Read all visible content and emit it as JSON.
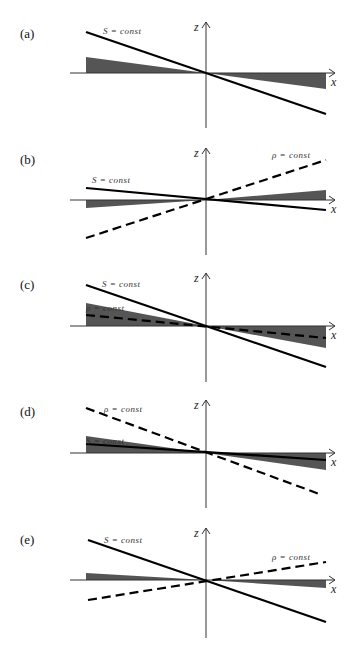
{
  "figure": {
    "axis_labels": {
      "x": "x",
      "z": "z"
    },
    "colors": {
      "shade": "#555555",
      "line": "#000000",
      "axis": "#333333"
    },
    "panels": [
      {
        "id": "a",
        "label": "(a)",
        "axis_y": 73,
        "z_top": 22,
        "z_bottom": 128,
        "shade": {
          "left_y": 57,
          "right_y": 89
        },
        "s_line": {
          "label": "S = const",
          "x1": 86,
          "y1": 32,
          "x2": 326,
          "y2": 114,
          "label_x": 103,
          "label_y": 34
        },
        "rho_line": null
      },
      {
        "id": "b",
        "label": "(b)",
        "axis_y": 200,
        "z_top": 148,
        "z_bottom": 255,
        "shade": {
          "left_y": 208,
          "right_y": 190
        },
        "s_line": {
          "label": "S = const",
          "x1": 86,
          "y1": 188,
          "x2": 326,
          "y2": 210,
          "label_x": 92,
          "label_y": 183
        },
        "rho_line": {
          "label": "ρ = const",
          "x1": 86,
          "y1": 238,
          "x2": 326,
          "y2": 160,
          "label_x": 272,
          "label_y": 158
        }
      },
      {
        "id": "c",
        "label": "(c)",
        "axis_y": 326,
        "z_top": 273,
        "z_bottom": 382,
        "shade": {
          "left_y": 303,
          "right_y": 348
        },
        "s_line": {
          "label": "S = const",
          "x1": 86,
          "y1": 285,
          "x2": 326,
          "y2": 367,
          "label_x": 102,
          "label_y": 287
        },
        "rho_line": {
          "label": "ρ = const",
          "x1": 86,
          "y1": 315,
          "x2": 326,
          "y2": 338,
          "label_x": 86,
          "label_y": 311
        }
      },
      {
        "id": "d",
        "label": "(d)",
        "axis_y": 453,
        "z_top": 400,
        "z_bottom": 508,
        "shade": {
          "left_y": 436,
          "right_y": 470
        },
        "s_line": {
          "label": "S = const",
          "x1": 86,
          "y1": 444,
          "x2": 326,
          "y2": 460,
          "label_x": 86,
          "label_y": 444
        },
        "rho_line": {
          "label": "ρ = const",
          "x1": 86,
          "y1": 408,
          "x2": 322,
          "y2": 495,
          "label_x": 104,
          "label_y": 412
        }
      },
      {
        "id": "e",
        "label": "(e)",
        "axis_y": 580,
        "z_top": 528,
        "z_bottom": 638,
        "shade": {
          "left_y": 573,
          "right_y": 588
        },
        "s_line": {
          "label": "S = const",
          "x1": 88,
          "y1": 540,
          "x2": 326,
          "y2": 622,
          "label_x": 104,
          "label_y": 543
        },
        "rho_line": {
          "label": "ρ = const",
          "x1": 88,
          "y1": 600,
          "x2": 326,
          "y2": 562,
          "label_x": 272,
          "label_y": 560
        }
      }
    ]
  }
}
